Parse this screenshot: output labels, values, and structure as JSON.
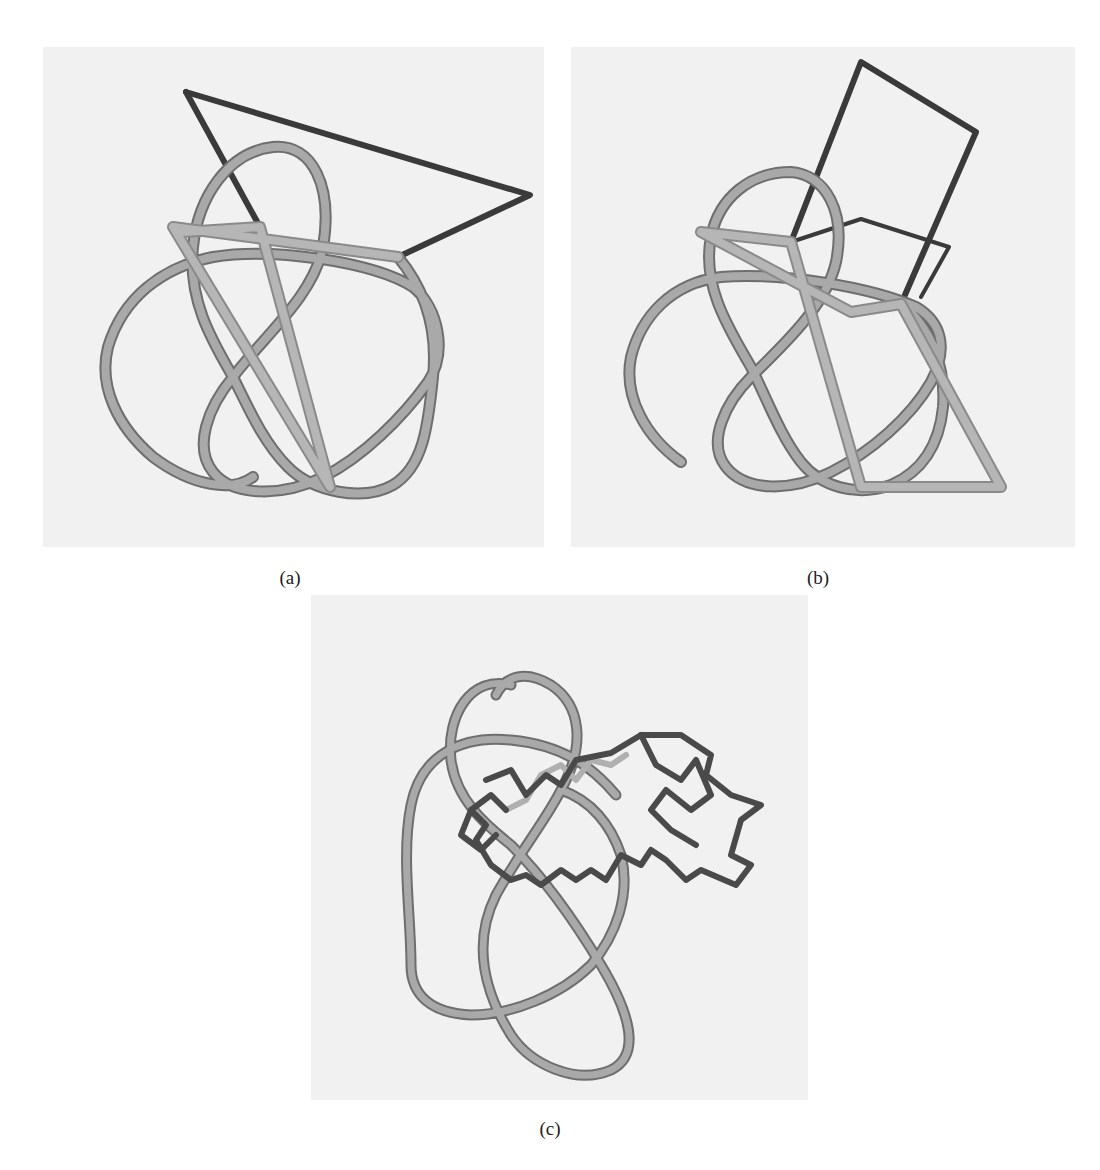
{
  "figure": {
    "panels": [
      {
        "id": "a",
        "label": "(a)",
        "description": "Figure-eight-like knot tube (light gray) with a dark triangular closing path and straight light segments"
      },
      {
        "id": "b",
        "label": "(b)",
        "description": "Same knot with a dark rectangular closing path and straight light quadrilateral segment"
      },
      {
        "id": "c",
        "label": "(c)",
        "description": "Same knot tube with a dark zig-zag polymer chain threaded through the upper loop"
      }
    ],
    "colors": {
      "background": "#ffffff",
      "panel_background": "#f1f1f1",
      "knot_tube": "#a9a9a9",
      "knot_tube_edge": "#6e6e6e",
      "closure_path": "#3a3a3a",
      "chain": "#4a4a4a"
    }
  }
}
